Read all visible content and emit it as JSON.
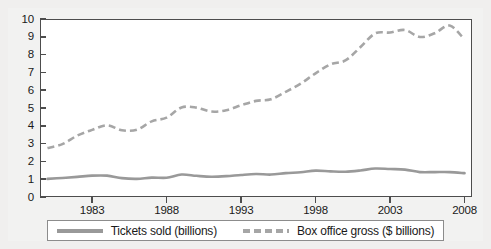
{
  "chart_data": {
    "type": "line",
    "title": "",
    "xlabel": "",
    "ylabel": "",
    "xlim": [
      1979.5,
      2008.5
    ],
    "ylim": [
      0,
      10
    ],
    "grid": false,
    "legend_position": "bottom",
    "x_tick_labels": [
      "1983",
      "1988",
      "1993",
      "1998",
      "2003",
      "2008"
    ],
    "x_tick_values": [
      1983,
      1988,
      1993,
      1998,
      2003,
      2008
    ],
    "y_tick_labels": [
      "0",
      "1",
      "2",
      "3",
      "4",
      "5",
      "6",
      "7",
      "8",
      "9",
      "10"
    ],
    "y_tick_values": [
      0,
      1,
      2,
      3,
      4,
      5,
      6,
      7,
      8,
      9,
      10
    ],
    "x": [
      1980,
      1981,
      1982,
      1983,
      1984,
      1985,
      1986,
      1987,
      1988,
      1989,
      1990,
      1991,
      1992,
      1993,
      1994,
      1995,
      1996,
      1997,
      1998,
      1999,
      2000,
      2001,
      2002,
      2003,
      2004,
      2005,
      2006,
      2007,
      2008
    ],
    "series": [
      {
        "name": "Tickets sold (billions)",
        "style": "solid",
        "color": "#999999",
        "values": [
          1.02,
          1.07,
          1.13,
          1.2,
          1.2,
          1.06,
          1.02,
          1.09,
          1.08,
          1.26,
          1.19,
          1.14,
          1.17,
          1.24,
          1.29,
          1.26,
          1.34,
          1.39,
          1.48,
          1.44,
          1.42,
          1.49,
          1.6,
          1.57,
          1.54,
          1.4,
          1.4,
          1.4,
          1.34
        ]
      },
      {
        "name": "Box office gross ($ billions)",
        "style": "dashed",
        "color": "#a6a6a6",
        "values": [
          2.75,
          2.97,
          3.45,
          3.77,
          4.03,
          3.75,
          3.78,
          4.25,
          4.46,
          5.03,
          5.02,
          4.8,
          4.87,
          5.15,
          5.4,
          5.49,
          5.91,
          6.37,
          6.95,
          7.45,
          7.67,
          8.41,
          9.19,
          9.24,
          9.38,
          8.99,
          9.2,
          9.63,
          8.85
        ]
      }
    ]
  },
  "axes": {
    "y_ticks": [
      {
        "label": "10",
        "value": 10
      },
      {
        "label": "9",
        "value": 9
      },
      {
        "label": "8",
        "value": 8
      },
      {
        "label": "7",
        "value": 7
      },
      {
        "label": "6",
        "value": 6
      },
      {
        "label": "5",
        "value": 5
      },
      {
        "label": "4",
        "value": 4
      },
      {
        "label": "3",
        "value": 3
      },
      {
        "label": "2",
        "value": 2
      },
      {
        "label": "1",
        "value": 1
      },
      {
        "label": "0",
        "value": 0
      }
    ],
    "x_ticks": [
      {
        "label": "1983",
        "value": 1983
      },
      {
        "label": "1988",
        "value": 1988
      },
      {
        "label": "1993",
        "value": 1993
      },
      {
        "label": "1998",
        "value": 1998
      },
      {
        "label": "2003",
        "value": 2003
      },
      {
        "label": "2008",
        "value": 2008
      }
    ]
  },
  "legend": {
    "items": [
      {
        "label": "Tickets sold (billions)",
        "style": "solid",
        "color": "#999999"
      },
      {
        "label": "Box office gross ($ billions)",
        "style": "dashed",
        "color": "#a6a6a6"
      }
    ]
  },
  "colors": {
    "tickets_line": "#999999",
    "gross_line": "#a6a6a6",
    "axis": "#4d4d4d",
    "text": "#1a1a1a",
    "page_background": "#f0efee",
    "plot_background": "#ffffff",
    "legend_border": "#8c8c8c"
  }
}
